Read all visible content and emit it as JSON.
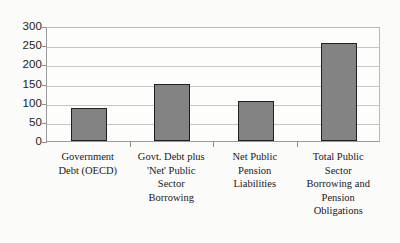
{
  "chart_data": {
    "type": "bar",
    "title": "",
    "subtitle": "",
    "xlabel": "",
    "ylabel": "",
    "ylim": [
      0,
      300
    ],
    "ytick_step": 50,
    "grid": true,
    "legend": false,
    "legend_position": "none",
    "bar_fill_color": "#838383",
    "bar_border_color": "#1f1f1f",
    "gridline_color": "#c6c6c6",
    "axis_color": "#9a9a9a",
    "background_color": "#fbfbfa",
    "categories": [
      "Government Debt (OECD)",
      "Govt. Debt plus 'Net' Public Sector Borrowing",
      "Net Public Pension Liabilities",
      "Total Public Sector Borrowing and Pension Obligations"
    ],
    "category_label_lines": [
      [
        "Government",
        "Debt (OECD)"
      ],
      [
        "Govt. Debt plus",
        "'Net' Public",
        "Sector",
        "Borrowing"
      ],
      [
        "Net Public",
        "Pension",
        "Liabilities"
      ],
      [
        "Total Public",
        "Sector",
        "Borrowing and",
        "Pension",
        "Obligations"
      ]
    ],
    "values": [
      86,
      149,
      104,
      256
    ],
    "yticks": [
      {
        "value": 300,
        "label": "300"
      },
      {
        "value": 250,
        "label": "250"
      },
      {
        "value": 200,
        "label": "200"
      },
      {
        "value": 150,
        "label": "150"
      },
      {
        "value": 100,
        "label": "100"
      },
      {
        "value": 50,
        "label": "50"
      },
      {
        "value": 0,
        "label": "0"
      }
    ]
  }
}
